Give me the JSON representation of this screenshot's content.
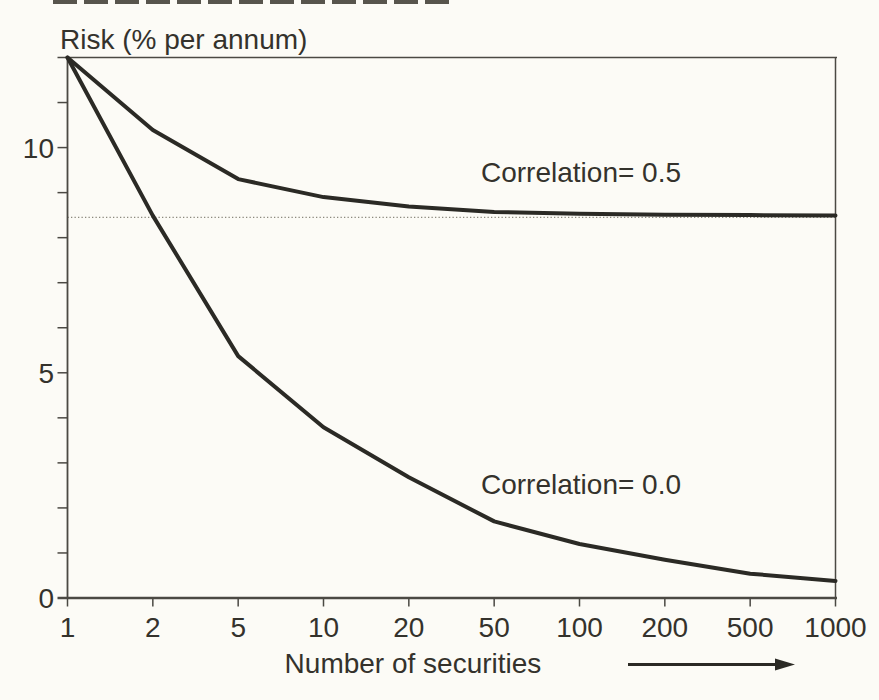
{
  "chart_data": {
    "type": "line",
    "title": "Risk (% per annum)",
    "xlabel": "Number of securities",
    "x_scale": "log-like, evenly spaced labeled ticks",
    "x_ticks": [
      1,
      2,
      5,
      10,
      20,
      50,
      100,
      200,
      500,
      1000
    ],
    "ylim": [
      0,
      12
    ],
    "y_major_ticks": [
      0,
      5,
      10
    ],
    "y_minor_tick_step": 1,
    "grid": false,
    "legend_position": "inline-annotations",
    "reference_line": {
      "value": 8.45,
      "style": "dotted"
    },
    "series": [
      {
        "name": "Correlation= 0.5",
        "values": [
          12,
          10.39,
          9.3,
          8.9,
          8.69,
          8.57,
          8.53,
          8.51,
          8.5,
          8.49
        ]
      },
      {
        "name": "Correlation= 0.0",
        "values": [
          12,
          8.49,
          5.37,
          3.79,
          2.68,
          1.7,
          1.2,
          0.85,
          0.54,
          0.38
        ]
      }
    ],
    "annotations": {
      "x_axis_direction_arrow": "right"
    }
  },
  "colors": {
    "background": "#fcfbf6",
    "curve_ink": "#2b2a25",
    "axis_ink": "#4b4943",
    "text_ink": "#34322c",
    "dotted_line": "#8b897e"
  }
}
